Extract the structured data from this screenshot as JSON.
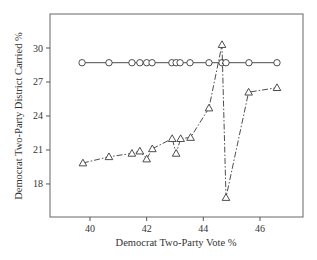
{
  "chart_data": {
    "type": "line",
    "title": "",
    "xlabel": "Democrat Two-Party Vote %",
    "ylabel": "Democrat Two-Party District Carried %",
    "xlim": [
      38.8,
      47.3
    ],
    "ylim": [
      15.3,
      32.9
    ],
    "xticks": [
      40,
      42,
      44,
      46
    ],
    "yticks": [
      18,
      21,
      24,
      27,
      30
    ],
    "grid": false,
    "legend": null,
    "series": [
      {
        "name": "circles-solid",
        "marker": "circle",
        "line_style": "solid",
        "x": [
          39.72,
          40.67,
          41.48,
          41.76,
          42.0,
          42.19,
          42.89,
          43.04,
          43.18,
          43.53,
          44.2,
          44.66,
          44.8,
          45.61,
          46.6
        ],
        "y": [
          28.7,
          28.7,
          28.7,
          28.7,
          28.7,
          28.7,
          28.7,
          28.7,
          28.7,
          28.7,
          28.7,
          28.7,
          28.7,
          28.7,
          28.7
        ]
      },
      {
        "name": "triangles-dashdot",
        "marker": "triangle",
        "line_style": "dashdot",
        "x": [
          39.75,
          40.67,
          41.48,
          41.76,
          42.0,
          42.2,
          42.9,
          43.04,
          43.2,
          43.55,
          44.2,
          44.66,
          44.8,
          45.6,
          46.6
        ],
        "y": [
          19.85,
          20.4,
          20.7,
          20.9,
          20.2,
          21.1,
          22.0,
          20.7,
          22.0,
          22.1,
          24.7,
          30.3,
          16.8,
          26.1,
          26.5
        ]
      }
    ]
  },
  "colors": {
    "line": "#3a3a3a",
    "axis": "#555555",
    "marker_fill": "#ffffff"
  }
}
